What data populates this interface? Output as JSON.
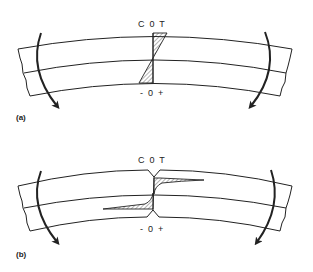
{
  "figure": {
    "panels": [
      {
        "id": "a",
        "caption": "(a)",
        "top_label": "C  0  T",
        "bottom_label": "-  0  +",
        "description": "Beam in bending with linear stress distribution (compression top, tension bottom)"
      },
      {
        "id": "b",
        "caption": "(b)",
        "top_label": "C  0  T",
        "bottom_label": "-  0  +",
        "description": "Notched beam in bending with stress concentration at notch roots"
      }
    ],
    "colors": {
      "line": "#222222",
      "background": "#ffffff"
    }
  }
}
